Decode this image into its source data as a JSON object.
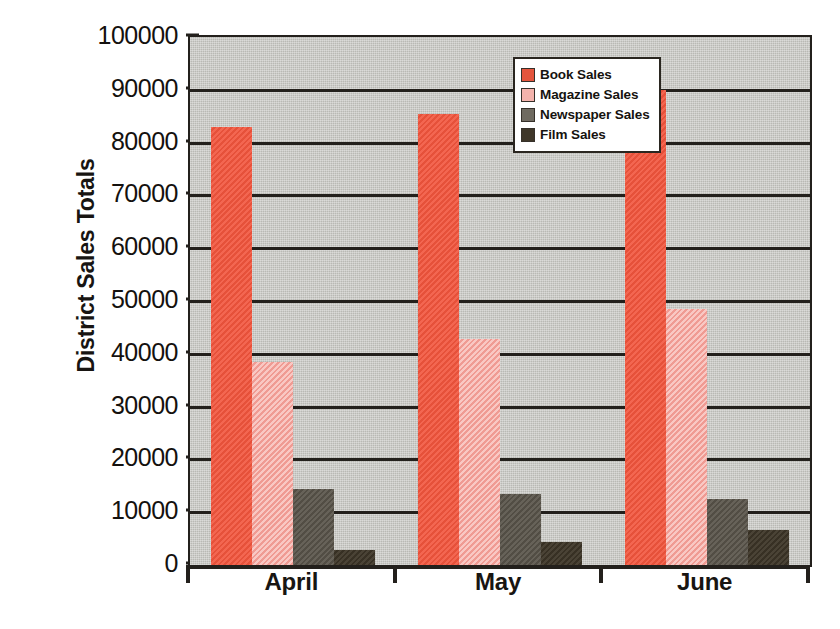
{
  "chart_data": {
    "type": "bar",
    "title": "",
    "xlabel": "",
    "ylabel": "District Sales Totals",
    "categories": [
      "April",
      "May",
      "June"
    ],
    "ylim": [
      0,
      100000
    ],
    "ytick_labels": [
      "100000",
      "90000",
      "80000",
      "70000",
      "60000",
      "50000",
      "40000",
      "30000",
      "20000",
      "10000",
      "0"
    ],
    "ytick_values": [
      100000,
      90000,
      80000,
      70000,
      60000,
      50000,
      40000,
      30000,
      20000,
      10000,
      0
    ],
    "grid": true,
    "legend_position": "upper right",
    "series": [
      {
        "name": "Book Sales",
        "color": "#f2553d",
        "values": [
          83000,
          85500,
          90000
        ]
      },
      {
        "name": "Magazine Sales",
        "color": "#f6aaa3",
        "values": [
          38500,
          42800,
          48500
        ]
      },
      {
        "name": "Newspaper Sales",
        "color": "#5b564c",
        "values": [
          14400,
          13400,
          12500
        ]
      },
      {
        "name": "Film Sales",
        "color": "#3f3729",
        "values": [
          2800,
          4300,
          6600
        ]
      }
    ],
    "plot_background": "#b9b9b4",
    "axis_color": "#23201c"
  }
}
